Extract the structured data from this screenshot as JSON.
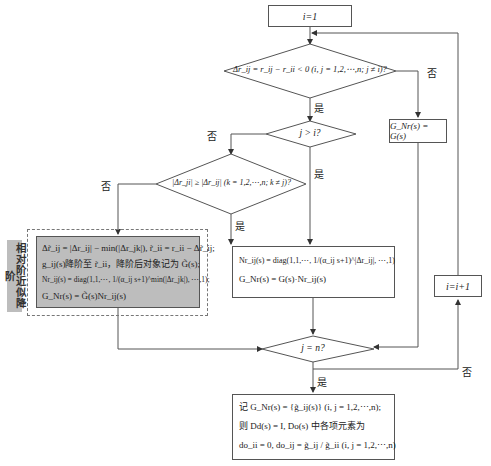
{
  "nodes": {
    "start": "i=1",
    "decision1": "Δr_ij = r_ij − r_ii < 0 (i, j = 1,2,⋯,n; j ≠ i)?",
    "decision2": "j > i?",
    "decision3": "|Δr_ji| ≥ |Δr_ij| (k = 1,2,⋯,n; k ≠ j)?",
    "gnr_equal": "G_Nr(s) = G(s)",
    "increment": "i=i+1",
    "decision4": "j = n?",
    "approx_block": {
      "line1": "Δr̃_ij = |Δr_ij| − min(|Δr_jk|), r̃_ii = r_ii − Δr̃_ij;",
      "line2": "g_ij(s)降阶至 r̃_ii，降阶后对象记为 G̃(s);",
      "line3": "Nr_ij(s) = diag(1,1,⋯, 1/(α_ij s+1)^min(|Δr_jk|), ⋯,1);",
      "line4": "G_Nr(s) = G̃(s)Nr_ij(s)"
    },
    "side_label": "相对阶近似降阶",
    "nr_block": {
      "line1": "Nr_ij(s) = diag(1,1,⋯, 1/(α_ij s+1)^|Δr_ij|, ⋯,1)",
      "line2": "G_Nr(s) = G(s)·Nr_ij(s)"
    },
    "result_block": {
      "line1": "记 G_Nr(s) = {g̃_ij(s)} (i, j = 1,2,⋯,n);",
      "line2": "则 Dd(s) = I, Do(s) 中各项元素为",
      "line3": "do_ii = 0, do_ij = g̃_ij / g̃_ii (i, j = 1,2,⋯,n)"
    }
  },
  "edge_labels": {
    "yes": "是",
    "no": "否"
  }
}
